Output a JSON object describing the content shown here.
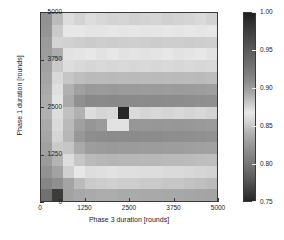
{
  "chart_data": {
    "type": "heatmap",
    "title": "",
    "xlabel": "Phase 3 duration [rounds]",
    "ylabel": "Phase 1 duration [rounds]",
    "xlim": [
      0,
      5000
    ],
    "ylim": [
      0,
      5000
    ],
    "xticks": [
      "0",
      "1250",
      "2500",
      "3750",
      "5000"
    ],
    "yticks": [
      "0",
      "1250",
      "2500",
      "3750",
      "5000"
    ],
    "xtick_values": [
      0,
      1250,
      2500,
      3750,
      5000
    ],
    "ytick_values": [
      0,
      1250,
      2500,
      3750,
      5000
    ],
    "grid": false,
    "colormap": "grayscale-jet",
    "colorbar": {
      "position": "right",
      "vmin": 0.75,
      "vmax": 1.0,
      "ticks": [
        "1.00",
        "0.95",
        "0.90",
        "0.85",
        "0.80",
        "0.75"
      ],
      "tick_values": [
        1.0,
        0.95,
        0.9,
        0.85,
        0.8,
        0.75
      ]
    },
    "x": [
      156,
      469,
      781,
      1094,
      1406,
      1719,
      2031,
      2344,
      2656,
      2969,
      3281,
      3594,
      3906,
      4219,
      4531,
      4844
    ],
    "y": [
      4844,
      4531,
      4219,
      3906,
      3594,
      3281,
      2969,
      2656,
      2344,
      2031,
      1719,
      1406,
      1094,
      781,
      469,
      156
    ],
    "values": [
      [
        0.838,
        0.862,
        0.873,
        0.869,
        0.873,
        0.871,
        0.869,
        0.87,
        0.868,
        0.869,
        0.87,
        0.868,
        0.869,
        0.87,
        0.872,
        0.869
      ],
      [
        0.841,
        0.866,
        0.878,
        0.878,
        0.88,
        0.879,
        0.878,
        0.879,
        0.878,
        0.879,
        0.879,
        0.878,
        0.879,
        0.878,
        0.879,
        0.878
      ],
      [
        0.845,
        0.869,
        0.891,
        0.893,
        0.895,
        0.893,
        0.894,
        0.893,
        0.892,
        0.893,
        0.894,
        0.893,
        0.893,
        0.894,
        0.893,
        0.892
      ],
      [
        0.847,
        0.858,
        0.875,
        0.876,
        0.878,
        0.875,
        0.877,
        0.875,
        0.876,
        0.875,
        0.876,
        0.877,
        0.875,
        0.876,
        0.877,
        0.875
      ],
      [
        0.85,
        0.866,
        0.884,
        0.886,
        0.888,
        0.886,
        0.887,
        0.886,
        0.887,
        0.886,
        0.887,
        0.886,
        0.887,
        0.886,
        0.887,
        0.886
      ],
      [
        0.853,
        0.871,
        0.898,
        0.903,
        0.906,
        0.905,
        0.906,
        0.905,
        0.906,
        0.905,
        0.906,
        0.905,
        0.906,
        0.905,
        0.906,
        0.904
      ],
      [
        0.856,
        0.874,
        0.912,
        0.926,
        0.931,
        0.93,
        0.931,
        0.93,
        0.93,
        0.929,
        0.93,
        0.929,
        0.93,
        0.929,
        0.928,
        0.927
      ],
      [
        0.858,
        0.876,
        0.918,
        0.938,
        0.944,
        0.943,
        0.944,
        0.943,
        0.943,
        0.942,
        0.942,
        0.941,
        0.941,
        0.94,
        0.939,
        0.938
      ],
      [
        0.859,
        0.873,
        0.901,
        0.912,
        0.873,
        0.87,
        0.871,
        0.998,
        0.872,
        0.87,
        0.871,
        0.87,
        0.871,
        0.87,
        0.871,
        0.869
      ],
      [
        0.857,
        0.872,
        0.906,
        0.926,
        0.934,
        0.93,
        0.881,
        0.875,
        0.933,
        0.932,
        0.933,
        0.932,
        0.933,
        0.932,
        0.931,
        0.93
      ],
      [
        0.854,
        0.87,
        0.908,
        0.932,
        0.94,
        0.941,
        0.942,
        0.941,
        0.942,
        0.941,
        0.941,
        0.94,
        0.94,
        0.939,
        0.938,
        0.937
      ],
      [
        0.85,
        0.866,
        0.898,
        0.918,
        0.928,
        0.93,
        0.931,
        0.93,
        0.93,
        0.929,
        0.929,
        0.928,
        0.928,
        0.927,
        0.926,
        0.925
      ],
      [
        0.845,
        0.86,
        0.884,
        0.898,
        0.906,
        0.908,
        0.909,
        0.908,
        0.908,
        0.907,
        0.907,
        0.906,
        0.906,
        0.905,
        0.904,
        0.903
      ],
      [
        0.838,
        0.851,
        0.868,
        0.878,
        0.873,
        0.874,
        0.875,
        0.874,
        0.874,
        0.873,
        0.873,
        0.872,
        0.872,
        0.871,
        0.87,
        0.869
      ],
      [
        0.828,
        0.836,
        0.852,
        0.862,
        0.866,
        0.867,
        0.868,
        0.867,
        0.867,
        0.866,
        0.866,
        0.865,
        0.865,
        0.864,
        0.863,
        0.862
      ],
      [
        0.806,
        0.762,
        0.851,
        0.855,
        0.857,
        0.858,
        0.858,
        0.857,
        0.857,
        0.856,
        0.856,
        0.855,
        0.855,
        0.854,
        0.853,
        0.852
      ]
    ]
  }
}
